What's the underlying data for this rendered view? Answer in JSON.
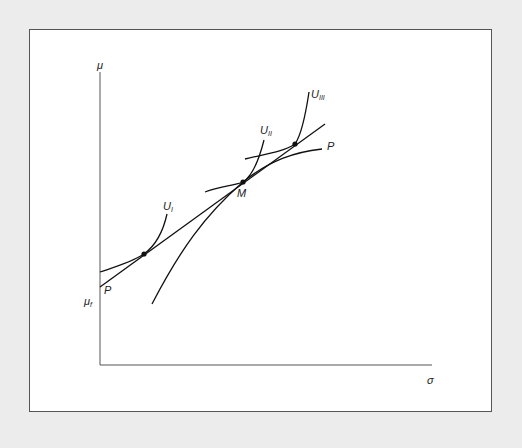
{
  "diagram": {
    "axes": {
      "y_label": "μ",
      "x_label": "σ",
      "origin_label": "μ",
      "origin_label_sub": "f"
    },
    "lines": {
      "capital_market_line": {
        "label": "P"
      },
      "capital_market_line_start": {
        "label": "P"
      }
    },
    "curves": [
      {
        "name": "U",
        "sub": "I"
      },
      {
        "name": "U",
        "sub": "II"
      },
      {
        "name": "U",
        "sub": "III"
      }
    ],
    "points": {
      "market_portfolio": {
        "label": "M"
      }
    },
    "colors": {
      "background": "#ececec",
      "panel": "#ffffff",
      "ink": "#111111",
      "axis": "#555555"
    }
  }
}
